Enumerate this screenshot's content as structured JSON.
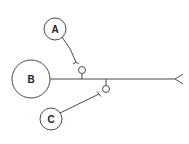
{
  "diagram": {
    "type": "neuron-synapse-schematic",
    "colors": {
      "stroke": "#4a4a4a",
      "label": "#222222",
      "background": "#ffffff"
    },
    "neurons": [
      {
        "id": "A",
        "label": "A",
        "role": "presynaptic neuron (axo-axonic, upper)"
      },
      {
        "id": "B",
        "label": "B",
        "role": "main neuron with axon"
      },
      {
        "id": "C",
        "label": "C",
        "role": "presynaptic neuron (axo-axonic, lower)"
      }
    ],
    "connections": [
      {
        "from": "A",
        "to": "B-axon",
        "kind": "synapse onto axon collateral (upper)"
      },
      {
        "from": "C",
        "to": "B-axon",
        "kind": "synapse onto axon collateral (lower)"
      }
    ],
    "axon_terminal": "forked ending at right"
  }
}
